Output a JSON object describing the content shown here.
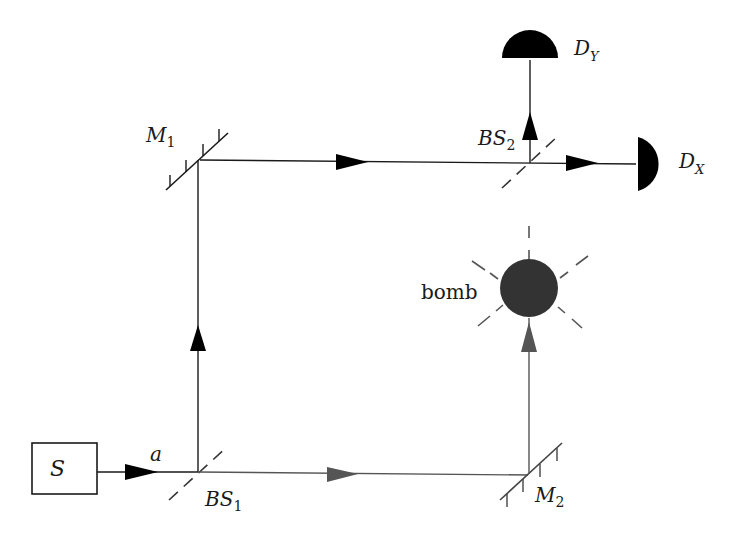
{
  "diagram": {
    "type": "Mach-Zehnder interferometer (Elitzur-Vaidman bomb tester)",
    "colors": {
      "upper_path": "#1a1a1a",
      "lower_path": "#555555",
      "bomb": "#333333",
      "detector": "#000000"
    },
    "labels": {
      "source": "S",
      "input_mode": "a",
      "bs1_main": "BS",
      "bs1_sub": "1",
      "bs2_main": "BS",
      "bs2_sub": "2",
      "m1_main": "M",
      "m1_sub": "1",
      "m2_main": "M",
      "m2_sub": "2",
      "dx_main": "D",
      "dx_sub": "X",
      "dy_main": "D",
      "dy_sub": "Y",
      "bomb": "bomb"
    }
  }
}
